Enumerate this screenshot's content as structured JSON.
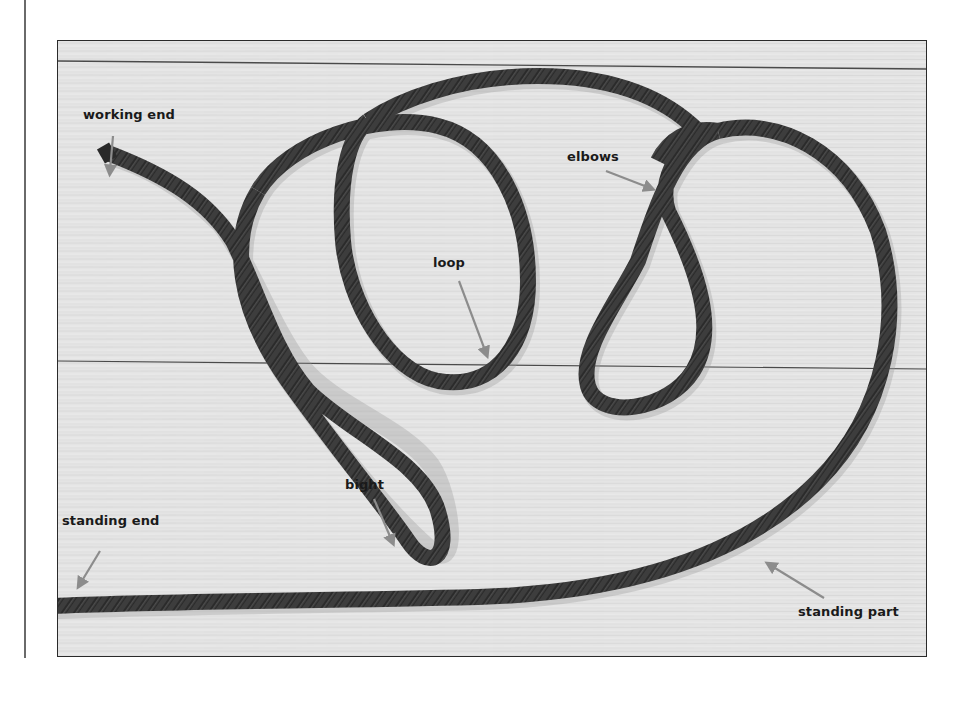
{
  "figure": {
    "labels": {
      "working_end": "working end",
      "elbows": "elbows",
      "loop": "loop",
      "bight": "bight",
      "standing_end": "standing end",
      "standing_part": "standing part"
    },
    "colors": {
      "background": "#e6e6e6",
      "rope": "#3a3a3a",
      "arrow": "#8c8c8c",
      "label_text": "#1a1a1a",
      "frame": "#2a2a2a"
    }
  }
}
